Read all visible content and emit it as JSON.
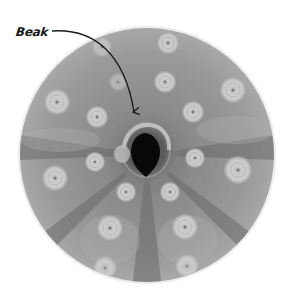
{
  "figure": {
    "annotation": {
      "label": "Beak",
      "arrow_start": [
        52,
        31
      ],
      "arrow_end": [
        136,
        119
      ]
    },
    "disc": {
      "center": [
        147,
        155
      ],
      "radius": 128,
      "base_color": "#8c8c8c",
      "rim_color": "#e6e6e6"
    },
    "mouth": {
      "center": [
        145,
        155
      ],
      "color": "#080808"
    },
    "tubercles": [
      {
        "x": 168,
        "y": 43,
        "r": 11
      },
      {
        "x": 102,
        "y": 47,
        "r": 10
      },
      {
        "x": 118,
        "y": 82,
        "r": 9
      },
      {
        "x": 165,
        "y": 82,
        "r": 11
      },
      {
        "x": 233,
        "y": 90,
        "r": 13
      },
      {
        "x": 57,
        "y": 102,
        "r": 13
      },
      {
        "x": 97,
        "y": 117,
        "r": 11
      },
      {
        "x": 193,
        "y": 112,
        "r": 11
      },
      {
        "x": 95,
        "y": 162,
        "r": 10
      },
      {
        "x": 195,
        "y": 158,
        "r": 10
      },
      {
        "x": 55,
        "y": 178,
        "r": 13
      },
      {
        "x": 238,
        "y": 170,
        "r": 14
      },
      {
        "x": 126,
        "y": 192,
        "r": 10
      },
      {
        "x": 170,
        "y": 192,
        "r": 10
      },
      {
        "x": 110,
        "y": 228,
        "r": 13
      },
      {
        "x": 185,
        "y": 227,
        "r": 13
      },
      {
        "x": 105,
        "y": 268,
        "r": 12
      },
      {
        "x": 187,
        "y": 266,
        "r": 12
      }
    ]
  }
}
